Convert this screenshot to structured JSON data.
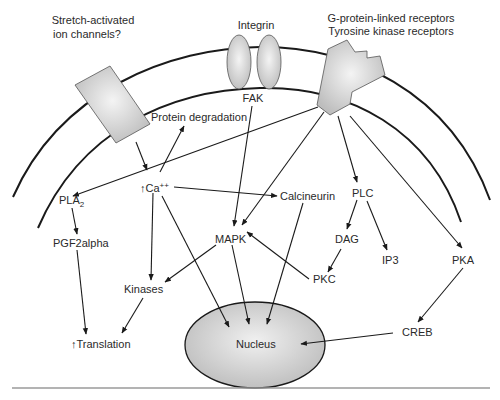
{
  "diagram": {
    "receptors": {
      "stretch_label_1": "Stretch-activated",
      "stretch_label_2": "ion channels?",
      "integrin": "Integrin",
      "gpcr_label_1": "G-protein-linked receptors",
      "gpcr_label_2": "Tyrosine kinase receptors"
    },
    "nodes": {
      "fak": "FAK",
      "protein_degradation": "Protein degradation",
      "ca_arrow": "↑",
      "ca": "Ca",
      "ca_sup": "++",
      "pla": "PLA",
      "pla_sub": "2",
      "pgf2alpha": "PGF2alpha",
      "calcineurin": "Calcineurin",
      "plc": "PLC",
      "mapk": "MAPK",
      "dag": "DAG",
      "ip3": "IP3",
      "pka": "PKA",
      "pkc": "PKC",
      "kinases": "Kinases",
      "translation_arrow": "↑",
      "translation": "Translation",
      "creb": "CREB",
      "nucleus": "Nucleus"
    },
    "colors": {
      "line": "#1a1a1a",
      "shape_fill": "#c8c8c8",
      "shape_highlight": "#f2f2f2",
      "text": "#2a2a2a",
      "divider": "#9a9a9a"
    }
  }
}
